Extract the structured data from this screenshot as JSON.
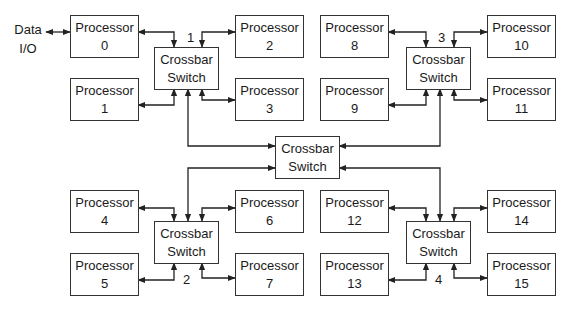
{
  "diagram": {
    "type": "hierarchical crossbar network",
    "io_label": [
      "Data",
      "I/O"
    ],
    "processor_label": "Processor",
    "crossbar_label": [
      "Crossbar",
      "Switch"
    ],
    "processors": [
      {
        "id": "0",
        "x": 70,
        "y": 15
      },
      {
        "id": "1",
        "x": 70,
        "y": 78
      },
      {
        "id": "2",
        "x": 235,
        "y": 15
      },
      {
        "id": "3",
        "x": 235,
        "y": 78
      },
      {
        "id": "8",
        "x": 320,
        "y": 15
      },
      {
        "id": "9",
        "x": 320,
        "y": 78
      },
      {
        "id": "10",
        "x": 487,
        "y": 15
      },
      {
        "id": "11",
        "x": 487,
        "y": 78
      },
      {
        "id": "4",
        "x": 70,
        "y": 190
      },
      {
        "id": "5",
        "x": 70,
        "y": 253
      },
      {
        "id": "6",
        "x": 235,
        "y": 190
      },
      {
        "id": "7",
        "x": 235,
        "y": 253
      },
      {
        "id": "12",
        "x": 320,
        "y": 190
      },
      {
        "id": "13",
        "x": 320,
        "y": 253
      },
      {
        "id": "14",
        "x": 487,
        "y": 190
      },
      {
        "id": "15",
        "x": 487,
        "y": 253
      }
    ],
    "crossbars": [
      {
        "number": "1",
        "x": 154,
        "y": 47,
        "number_x": 187,
        "number_y": 30
      },
      {
        "number": "3",
        "x": 406,
        "y": 47,
        "number_x": 438,
        "number_y": 30
      },
      {
        "number": "2",
        "x": 154,
        "y": 221,
        "number_x": 183,
        "number_y": 272
      },
      {
        "number": "4",
        "x": 406,
        "y": 221,
        "number_x": 435,
        "number_y": 272
      },
      {
        "number": "",
        "x": 275,
        "y": 136,
        "central": true
      }
    ],
    "links": [
      "Data I/O <-> Processor 0",
      "Crossbar 1 <-> Processors 0,1,2,3",
      "Crossbar 3 <-> Processors 8,9,10,11",
      "Crossbar 2 <-> Processors 4,5,6,7",
      "Crossbar 4 <-> Processors 12,13,14,15",
      "Central Crossbar <-> Crossbars 1,2,3,4"
    ]
  }
}
